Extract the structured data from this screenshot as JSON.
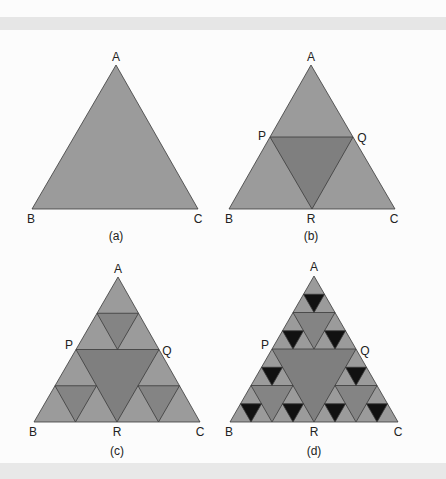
{
  "colors": {
    "background": "#fcfcfc",
    "band": "#e6e6e6",
    "level0": "#9b9b9b",
    "level1": "#7f7f7f",
    "level2": "#848484",
    "level3": "#111111",
    "stroke": "#3a3a3a"
  },
  "panels": [
    {
      "id": "a",
      "caption": "(a)",
      "depth": 0,
      "vertices": {
        "A": [
          116,
          65
        ],
        "B": [
          32,
          209
        ],
        "C": [
          198,
          209
        ]
      },
      "labels": [
        {
          "text": "A",
          "x": 116,
          "y": 61
        },
        {
          "text": "B",
          "x": 31,
          "y": 223
        },
        {
          "text": "C",
          "x": 198,
          "y": 223
        }
      ],
      "caption_pos": [
        116,
        240
      ]
    },
    {
      "id": "b",
      "caption": "(b)",
      "depth": 1,
      "vertices": {
        "A": [
          311,
          65
        ],
        "B": [
          229,
          209
        ],
        "C": [
          395,
          209
        ]
      },
      "labels": [
        {
          "text": "A",
          "x": 311,
          "y": 61
        },
        {
          "text": "P",
          "x": 262,
          "y": 140
        },
        {
          "text": "Q",
          "x": 362,
          "y": 142
        },
        {
          "text": "B",
          "x": 229,
          "y": 223
        },
        {
          "text": "R",
          "x": 311,
          "y": 223
        },
        {
          "text": "C",
          "x": 394,
          "y": 223
        }
      ],
      "caption_pos": [
        311,
        240
      ]
    },
    {
      "id": "c",
      "caption": "(c)",
      "depth": 2,
      "vertices": {
        "A": [
          118,
          277
        ],
        "B": [
          34,
          422
        ],
        "C": [
          200,
          422
        ]
      },
      "labels": [
        {
          "text": "A",
          "x": 118,
          "y": 273
        },
        {
          "text": "P",
          "x": 69,
          "y": 349
        },
        {
          "text": "Q",
          "x": 167,
          "y": 355
        },
        {
          "text": "B",
          "x": 33,
          "y": 436
        },
        {
          "text": "R",
          "x": 117,
          "y": 436
        },
        {
          "text": "C",
          "x": 200,
          "y": 436
        }
      ],
      "caption_pos": [
        117,
        455
      ]
    },
    {
      "id": "d",
      "caption": "(d)",
      "depth": 3,
      "vertices": {
        "A": [
          314,
          276
        ],
        "B": [
          230,
          422
        ],
        "C": [
          398,
          422
        ]
      },
      "labels": [
        {
          "text": "A",
          "x": 314,
          "y": 271
        },
        {
          "text": "P",
          "x": 265,
          "y": 349
        },
        {
          "text": "Q",
          "x": 365,
          "y": 355
        },
        {
          "text": "B",
          "x": 229,
          "y": 436
        },
        {
          "text": "R",
          "x": 314,
          "y": 436
        },
        {
          "text": "C",
          "x": 398,
          "y": 436
        }
      ],
      "caption_pos": [
        314,
        455
      ]
    }
  ]
}
